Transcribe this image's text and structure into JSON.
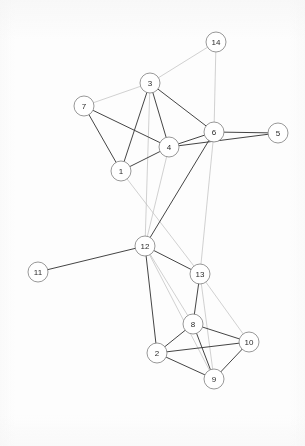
{
  "figure": {
    "type": "network-graph",
    "title": "",
    "background_color": "#fdfdfd",
    "node_fill": "#ffffff",
    "node_stroke": "#8c8c8c",
    "label_color": "#2b2b2b",
    "edge_color_dark": "#3a3a3a",
    "edge_color_light": "#b9b9b9",
    "width": 305,
    "height": 446
  },
  "chart_data": {
    "type": "scatter",
    "xlabel": "",
    "ylabel": "",
    "xlim": [
      0,
      305
    ],
    "ylim": [
      0,
      446
    ],
    "grid": false,
    "legend": "none",
    "node_count": 14,
    "edge_count": 37,
    "nodes": [
      {
        "id": "1",
        "label": "1",
        "x": 121,
        "y": 171,
        "r": 10,
        "degree": 4
      },
      {
        "id": "2",
        "label": "2",
        "x": 157,
        "y": 353,
        "r": 10,
        "degree": 4
      },
      {
        "id": "3",
        "label": "3",
        "x": 150,
        "y": 83,
        "r": 10,
        "degree": 6
      },
      {
        "id": "4",
        "label": "4",
        "x": 169,
        "y": 147,
        "r": 10,
        "degree": 8
      },
      {
        "id": "5",
        "label": "5",
        "x": 278,
        "y": 133,
        "r": 10,
        "degree": 2
      },
      {
        "id": "6",
        "label": "6",
        "x": 214,
        "y": 132,
        "r": 10,
        "degree": 7
      },
      {
        "id": "7",
        "label": "7",
        "x": 84,
        "y": 106,
        "r": 10,
        "degree": 3
      },
      {
        "id": "8",
        "label": "8",
        "x": 193,
        "y": 324,
        "r": 10,
        "degree": 5
      },
      {
        "id": "9",
        "label": "9",
        "x": 214,
        "y": 379,
        "r": 10,
        "degree": 4
      },
      {
        "id": "10",
        "label": "10",
        "x": 249,
        "y": 342,
        "r": 10,
        "degree": 4
      },
      {
        "id": "11",
        "label": "11",
        "x": 38,
        "y": 272,
        "r": 10,
        "degree": 1
      },
      {
        "id": "12",
        "label": "12",
        "x": 145,
        "y": 246,
        "r": 10,
        "degree": 8
      },
      {
        "id": "13",
        "label": "13",
        "x": 200,
        "y": 274,
        "r": 10,
        "degree": 5
      },
      {
        "id": "14",
        "label": "14",
        "x": 216,
        "y": 42,
        "r": 10,
        "degree": 2
      }
    ],
    "edges": [
      {
        "source": "3",
        "target": "14",
        "weight": "light"
      },
      {
        "source": "6",
        "target": "14",
        "weight": "light"
      },
      {
        "source": "3",
        "target": "7",
        "weight": "light"
      },
      {
        "source": "3",
        "target": "1",
        "weight": "dark"
      },
      {
        "source": "3",
        "target": "4",
        "weight": "dark"
      },
      {
        "source": "3",
        "target": "6",
        "weight": "dark"
      },
      {
        "source": "3",
        "target": "12",
        "weight": "light"
      },
      {
        "source": "7",
        "target": "1",
        "weight": "dark"
      },
      {
        "source": "7",
        "target": "4",
        "weight": "dark"
      },
      {
        "source": "1",
        "target": "4",
        "weight": "dark"
      },
      {
        "source": "1",
        "target": "13",
        "weight": "light"
      },
      {
        "source": "4",
        "target": "6",
        "weight": "dark"
      },
      {
        "source": "4",
        "target": "5",
        "weight": "dark"
      },
      {
        "source": "4",
        "target": "12",
        "weight": "light"
      },
      {
        "source": "5",
        "target": "6",
        "weight": "dark"
      },
      {
        "source": "6",
        "target": "12",
        "weight": "dark"
      },
      {
        "source": "6",
        "target": "13",
        "weight": "light"
      },
      {
        "source": "11",
        "target": "12",
        "weight": "dark"
      },
      {
        "source": "12",
        "target": "13",
        "weight": "dark"
      },
      {
        "source": "12",
        "target": "2",
        "weight": "dark"
      },
      {
        "source": "12",
        "target": "8",
        "weight": "light"
      },
      {
        "source": "12",
        "target": "9",
        "weight": "light"
      },
      {
        "source": "13",
        "target": "8",
        "weight": "dark"
      },
      {
        "source": "13",
        "target": "9",
        "weight": "light"
      },
      {
        "source": "13",
        "target": "10",
        "weight": "light"
      },
      {
        "source": "8",
        "target": "2",
        "weight": "dark"
      },
      {
        "source": "8",
        "target": "9",
        "weight": "dark"
      },
      {
        "source": "8",
        "target": "10",
        "weight": "dark"
      },
      {
        "source": "2",
        "target": "9",
        "weight": "dark"
      },
      {
        "source": "2",
        "target": "10",
        "weight": "dark"
      },
      {
        "source": "9",
        "target": "10",
        "weight": "dark"
      }
    ]
  }
}
